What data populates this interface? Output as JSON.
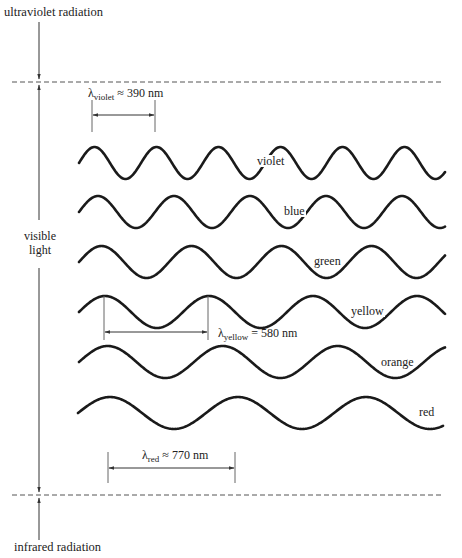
{
  "title_top": "ultraviolet radiation",
  "title_bottom": "infrared radiation",
  "region_label": [
    "visible",
    "light"
  ],
  "colors": {
    "ink": "#1a1a1a",
    "dash": "#555555",
    "marker": "#666666"
  },
  "boundaries": {
    "upper_y": 82,
    "lower_y": 495,
    "x_start": 12,
    "x_end": 444
  },
  "waves": [
    {
      "name": "violet",
      "label": "violet",
      "cy": 163,
      "amp": 16,
      "period": 62,
      "x0": 79,
      "x1": 445,
      "label_x": 256,
      "label_y": 155
    },
    {
      "name": "blue",
      "label": "blue",
      "cy": 212,
      "amp": 16,
      "period": 76,
      "x0": 79,
      "x1": 445,
      "label_x": 283,
      "label_y": 205
    },
    {
      "name": "green",
      "label": "green",
      "cy": 262,
      "amp": 16,
      "period": 90,
      "x0": 79,
      "x1": 445,
      "label_x": 313,
      "label_y": 255
    },
    {
      "name": "yellow",
      "label": "yellow",
      "cy": 312,
      "amp": 16,
      "period": 104,
      "x0": 79,
      "x1": 445,
      "label_x": 350,
      "label_y": 305
    },
    {
      "name": "orange",
      "label": "orange",
      "cy": 362,
      "amp": 16,
      "period": 115,
      "x0": 79,
      "x1": 445,
      "label_x": 380,
      "label_y": 356
    },
    {
      "name": "red",
      "label": "red",
      "cy": 413,
      "amp": 16,
      "period": 128,
      "x0": 78,
      "x1": 443,
      "label_x": 418,
      "label_y": 406
    }
  ],
  "measurements": [
    {
      "name": "violet",
      "symbol": "λ",
      "sub": "violet",
      "relation": "≈",
      "value": "390 nm",
      "xa": 92,
      "xb": 155,
      "ytop": 100,
      "ybot": 132,
      "arrow_y": 115,
      "label_x": 88,
      "label_y": 87
    },
    {
      "name": "yellow",
      "symbol": "λ",
      "sub": "yellow",
      "relation": "=",
      "value": "580 nm",
      "xa": 104,
      "xb": 208,
      "ytop": 296,
      "ybot": 340,
      "arrow_y": 332,
      "label_x": 218,
      "label_y": 327
    },
    {
      "name": "red",
      "symbol": "λ",
      "sub": "red",
      "relation": "≈",
      "value": "770 nm",
      "xa": 108,
      "xb": 235,
      "ytop": 452,
      "ybot": 483,
      "arrow_y": 468,
      "label_x": 142,
      "label_y": 449
    }
  ]
}
